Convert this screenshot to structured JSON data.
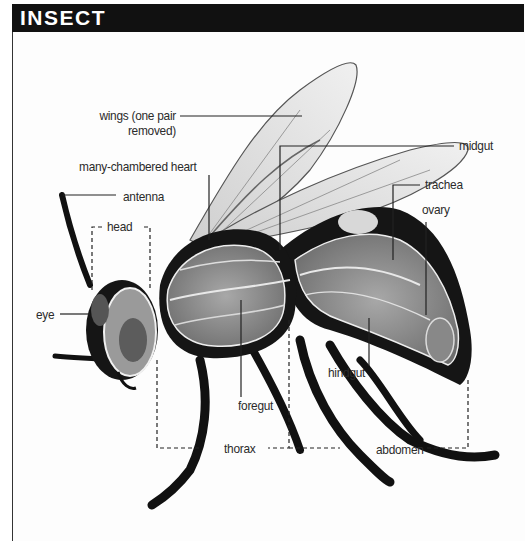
{
  "title": "INSECT",
  "diagram": {
    "labels": {
      "wings_line1": "wings (one pair",
      "wings_line2": "removed)",
      "heart": "many-chambered heart",
      "antenna": "antenna",
      "head": "head",
      "eye": "eye",
      "midgut": "midgut",
      "trachea": "trachea",
      "ovary": "ovary",
      "hindgut": "hindgut",
      "foregut": "foregut",
      "thorax": "thorax",
      "abdomen": "abdomen"
    },
    "colors": {
      "title_bar": "#111111",
      "title_text": "#ffffff",
      "label_text": "#2b2b2b",
      "leader_line": "#222222"
    }
  }
}
